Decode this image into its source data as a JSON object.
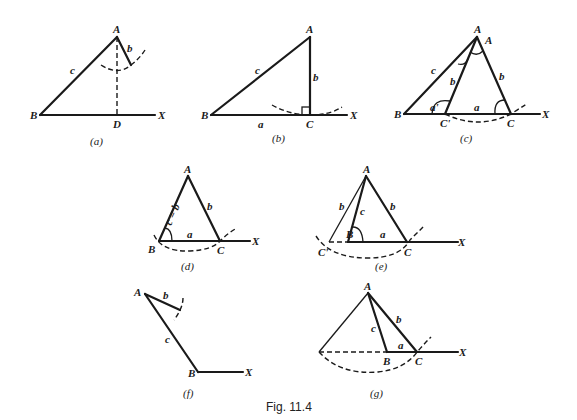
{
  "caption": "Fig. 11.4",
  "figures": {
    "a": {
      "subcaption": "(a)",
      "labels": {
        "A": "A",
        "B": "B",
        "D": "D",
        "X": "X",
        "c": "c",
        "b": "b"
      }
    },
    "b": {
      "subcaption": "(b)",
      "labels": {
        "A": "A",
        "B": "B",
        "C": "C",
        "X": "X",
        "a": "a",
        "b": "b",
        "c": "c"
      }
    },
    "c": {
      "subcaption": "(c)",
      "labels": {
        "A": "A",
        "A2": "A",
        "B": "B",
        "C": "C",
        "Cp": "C'",
        "X": "X",
        "a": "a",
        "ap": "a'",
        "b1": "b",
        "b2": "b",
        "c": "c"
      }
    },
    "d": {
      "subcaption": "(d)",
      "labels": {
        "A": "A",
        "B": "B",
        "C": "C",
        "X": "X",
        "a": "a",
        "b": "b",
        "ceqb": "c = b"
      }
    },
    "e": {
      "subcaption": "(e)",
      "labels": {
        "A": "A",
        "B": "B",
        "C": "C",
        "Cp": "C'",
        "X": "X",
        "a": "a",
        "b1": "b",
        "b2": "b",
        "c": "c"
      }
    },
    "f": {
      "subcaption": "(f)",
      "labels": {
        "A": "A",
        "B": "B",
        "X": "X",
        "b": "b",
        "c": "c"
      }
    },
    "g": {
      "subcaption": "(g)",
      "labels": {
        "A": "A",
        "B": "B",
        "C": "C",
        "X": "X",
        "a": "a",
        "b": "b",
        "c": "c"
      }
    }
  }
}
